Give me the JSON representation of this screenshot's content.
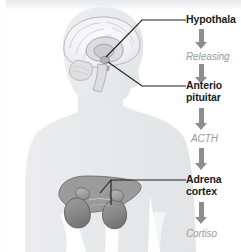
{
  "diagram": {
    "background_color": "#ffffff",
    "silhouette_color": "#e8e9eb",
    "label_color": "#1b1b1b",
    "hormone_color": "#9a9a9a",
    "arrow_color": "#8d8d8d",
    "leader_line_color": "#1f1f1f"
  },
  "anatomy": [
    {
      "name": "head-brain-sagittal",
      "caption": "Sagittal section of head showing brain, hypothalamus and pituitary"
    },
    {
      "name": "kidneys-adrenal-glands",
      "caption": "Kidneys with adrenal glands"
    }
  ],
  "axis": {
    "organs": [
      {
        "id": "hypothalamus",
        "line1": "Hypothala",
        "line2": ""
      },
      {
        "id": "anterior-pituitary",
        "line1": "Anterio",
        "line2": "pituitar"
      },
      {
        "id": "adrenal-cortex",
        "line1": "Adrena",
        "line2": "cortex"
      }
    ],
    "hormones": [
      {
        "id": "releasing-hormone",
        "text": "Releasing"
      },
      {
        "id": "acth",
        "text": "ACTH"
      },
      {
        "id": "cortisol",
        "text": "Cortiso"
      }
    ]
  }
}
